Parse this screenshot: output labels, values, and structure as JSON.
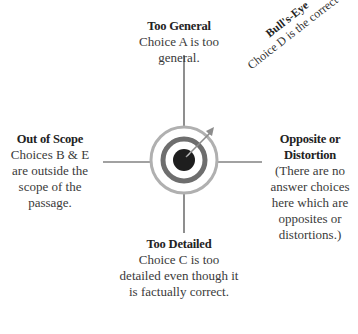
{
  "diagram": {
    "type": "target-diagram",
    "colors": {
      "line": "#444444",
      "outer_ring": "#b0b0b0",
      "middle_ring": "#6e6e6e",
      "bullseye": "#1e1e1e",
      "arrow": "#8c8c8c",
      "text": "#333333"
    },
    "arms": {
      "top": {
        "title": "Too General",
        "body": "Choice A is too general."
      },
      "left": {
        "title": "Out of Scope",
        "body": "Choices B & E are outside the scope of the passage."
      },
      "right": {
        "title": "Opposite or Distortion",
        "body": "(There are no answer choices here which are opposites or distortions.)"
      },
      "bottom": {
        "title": "Too Detailed",
        "body": "Choice C is too detailed even though it is factually correct."
      }
    },
    "bullseye_callout": {
      "title": "Bull's-Eye",
      "body": "Choice D is the correct answer."
    }
  }
}
